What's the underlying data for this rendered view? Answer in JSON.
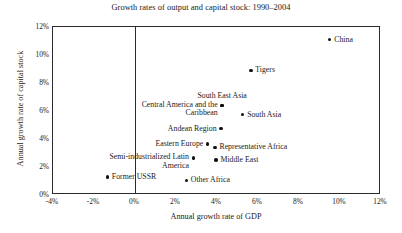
{
  "chart_data": {
    "type": "scatter",
    "title": "Growth rates of output and capital stock: 1990–2004",
    "xlabel": "Annual growth rate of GDP",
    "ylabel": "Annual growth rate of capital stock",
    "xlim": [
      -4,
      12
    ],
    "ylim": [
      0,
      12
    ],
    "xticks": [
      "-4%",
      "-2%",
      "0%",
      "2%",
      "4%",
      "6%",
      "8%",
      "10%",
      "12%"
    ],
    "xtick_values": [
      -4,
      -2,
      0,
      2,
      4,
      6,
      8,
      10,
      12
    ],
    "yticks": [
      "0%",
      "2%",
      "4%",
      "6%",
      "8%",
      "10%",
      "12%"
    ],
    "ytick_values": [
      0,
      2,
      4,
      6,
      8,
      10,
      12
    ],
    "grid": false,
    "legend": false,
    "zero_reference_line_x": 0,
    "marker_color": "#111111",
    "frame_color": "#2b2b2b",
    "background": "#ffffff",
    "points": [
      {
        "label": "China",
        "x": 9.5,
        "y": 11.1,
        "label_pos": "right"
      },
      {
        "label": "Tigers",
        "x": 5.65,
        "y": 8.9,
        "label_pos": "right"
      },
      {
        "label": "South East Asia",
        "x": 4.25,
        "y": 6.4,
        "label_pos": "above"
      },
      {
        "label": "South Asia",
        "x": 5.25,
        "y": 5.75,
        "label_pos": "right"
      },
      {
        "label": "Central America and the Caribbean",
        "x": 4.25,
        "y": 6.4,
        "label_pos": "left-two"
      },
      {
        "label": "Andean Region",
        "x": 4.2,
        "y": 4.75,
        "label_pos": "left"
      },
      {
        "label": "Eastern Europe",
        "x": 3.55,
        "y": 3.65,
        "label_pos": "left"
      },
      {
        "label": "Representative Africa",
        "x": 3.9,
        "y": 3.4,
        "label_pos": "right"
      },
      {
        "label": "Semi-industrialized Latin America",
        "x": 2.85,
        "y": 2.65,
        "label_pos": "left-two"
      },
      {
        "label": "Middle East",
        "x": 3.95,
        "y": 2.5,
        "label_pos": "right"
      },
      {
        "label": "Former USSR",
        "x": -1.35,
        "y": 1.3,
        "label_pos": "right"
      },
      {
        "label": "Other Africa",
        "x": 2.5,
        "y": 1.05,
        "label_pos": "right"
      }
    ]
  }
}
